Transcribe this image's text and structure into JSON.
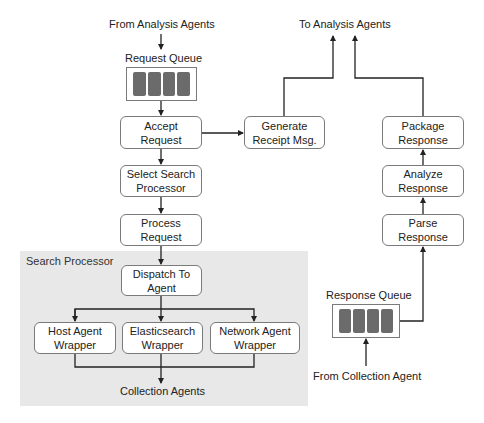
{
  "diagram": {
    "top_input_label": "From Analysis Agents",
    "top_output_label": "To Analysis Agents",
    "request_queue": {
      "label": "Request Queue",
      "slots": 4
    },
    "response_queue": {
      "label": "Response Queue",
      "slots": 4
    },
    "bottom_input_label": "From Collection Agent",
    "search_processor": {
      "label": "Search Processor",
      "output_label": "Collection Agents"
    },
    "nodes": {
      "accept_request": "Accept\nRequest",
      "generate_receipt": "Generate\nReceipt Msg.",
      "select_search_processor": "Select Search\nProcessor",
      "process_request": "Process\nRequest",
      "dispatch_to_agent": "Dispatch To\nAgent",
      "host_agent_wrapper": "Host Agent\nWrapper",
      "elasticsearch_wrapper": "Elasticsearch\nWrapper",
      "network_agent_wrapper": "Network Agent\nWrapper",
      "package_response": "Package\nResponse",
      "analyze_response": "Analyze\nResponse",
      "parse_response": "Parse\nResponse"
    },
    "colors": {
      "region_fill": "#e8e8e8",
      "queue_slot": "#6b6b6b",
      "border": "#7a7a7a",
      "line": "#222222"
    }
  }
}
